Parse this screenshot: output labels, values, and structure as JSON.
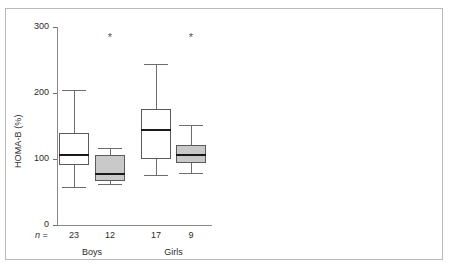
{
  "figure": {
    "background_color": "#ffffff",
    "frame_color": "#b9b9b9",
    "open_box_color": "#ffffff",
    "filled_box_color": "#c9c9c9",
    "line_color": "#5a5a5a",
    "median_color": "#1a1a1a",
    "significance_marker": "*",
    "n_prefix": "n ="
  },
  "chart_data": [
    {
      "type": "box",
      "title": "",
      "panel": "left",
      "xlabel": "",
      "ylabel": "HOMA-B (%)",
      "ylim": [
        0,
        300
      ],
      "yticks": [
        0,
        100,
        200,
        300
      ],
      "ytick_labels": [
        "0",
        "100",
        "200",
        "300"
      ],
      "grid": false,
      "legend": "none",
      "group_labels": [
        "Boys",
        "Girls"
      ],
      "boxes": [
        {
          "label": "Boys",
          "fill": "open",
          "n": 23,
          "whisker_low": 57,
          "q1": 91,
          "median": 106,
          "q3": 140,
          "whisker_high": 205,
          "significant": false
        },
        {
          "label": "Boys",
          "fill": "filled",
          "n": 12,
          "whisker_low": 62,
          "q1": 67,
          "median": 77,
          "q3": 106,
          "whisker_high": 117,
          "significant": true
        },
        {
          "label": "Girls",
          "fill": "open",
          "n": 17,
          "whisker_low": 76,
          "q1": 100,
          "median": 144,
          "q3": 176,
          "whisker_high": 244,
          "significant": false
        },
        {
          "label": "Girls",
          "fill": "filled",
          "n": 9,
          "whisker_low": 79,
          "q1": 94,
          "median": 106,
          "q3": 121,
          "whisker_high": 152,
          "significant": true
        }
      ]
    },
    {
      "type": "box",
      "title": "",
      "panel": "right",
      "xlabel": "",
      "ylabel": "HOMA-S (%)",
      "ylim": [
        0,
        400
      ],
      "yticks": [
        0,
        100,
        200,
        300,
        400
      ],
      "ytick_labels": [
        "0",
        "100",
        "200",
        "300",
        "400"
      ],
      "grid": false,
      "legend": "none",
      "group_labels": [
        "Boys",
        "Girls"
      ],
      "boxes": [
        {
          "label": "Boys",
          "fill": "open",
          "n": 23,
          "whisker_low": 33,
          "q1": 78,
          "median": 108,
          "q3": 137,
          "whisker_high": 224,
          "significant": false
        },
        {
          "label": "Boys",
          "fill": "filled",
          "n": 12,
          "whisker_low": 84,
          "q1": 103,
          "median": 184,
          "q3": 271,
          "whisker_high": 342,
          "significant": true
        },
        {
          "label": "Girls",
          "fill": "open",
          "n": 17,
          "whisker_low": 37,
          "q1": 63,
          "median": 70,
          "q3": 131,
          "whisker_high": 177,
          "significant": false
        },
        {
          "label": "Girls",
          "fill": "filled",
          "n": 9,
          "whisker_low": 94,
          "q1": 107,
          "median": 139,
          "q3": 195,
          "whisker_high": 278,
          "significant": true
        }
      ]
    }
  ]
}
